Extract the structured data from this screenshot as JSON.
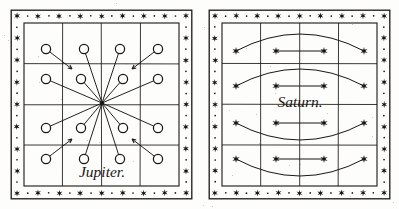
{
  "figure": {
    "medium": "engraved plate",
    "ink_color": "#1a1713",
    "paper_color": "#fdfdfb",
    "panel_count": 2
  },
  "border": {
    "style": "alternating star and dot band",
    "star_glyph": "six-pointed-star",
    "dot_glyph": "round-dot",
    "outer_rule": true,
    "inner_rule": true,
    "stars_per_edge": 8
  },
  "panels": [
    {
      "id": "jupiter",
      "label": "Jupiter.",
      "label_x": 92,
      "label_y": 168,
      "grid": {
        "rows": 4,
        "cols": 4
      },
      "marker_glyph": "open-circle",
      "center": {
        "x": 92,
        "y": 94
      },
      "spokes": [
        {
          "name": "spoke-nnw",
          "x": 74,
          "y": 40
        },
        {
          "name": "spoke-nne",
          "x": 110,
          "y": 40
        },
        {
          "name": "spoke-wnw",
          "x": 36,
          "y": 70
        },
        {
          "name": "spoke-w",
          "x": 71,
          "y": 70
        },
        {
          "name": "spoke-e",
          "x": 113,
          "y": 70
        },
        {
          "name": "spoke-ene",
          "x": 148,
          "y": 70
        },
        {
          "name": "spoke-wsw",
          "x": 36,
          "y": 119
        },
        {
          "name": "spoke-sw",
          "x": 71,
          "y": 119
        },
        {
          "name": "spoke-se",
          "x": 113,
          "y": 119
        },
        {
          "name": "spoke-ese",
          "x": 148,
          "y": 119
        },
        {
          "name": "spoke-ssw",
          "x": 74,
          "y": 150
        },
        {
          "name": "spoke-sse",
          "x": 110,
          "y": 150
        }
      ],
      "corner_arrows": [
        {
          "name": "arrow-top-left",
          "cx": 36,
          "cy": 40,
          "dx": 26,
          "dy": 20
        },
        {
          "name": "arrow-top-right",
          "cx": 148,
          "cy": 40,
          "dx": -26,
          "dy": 20
        },
        {
          "name": "arrow-bottom-left",
          "cx": 36,
          "cy": 150,
          "dx": 26,
          "dy": -20
        },
        {
          "name": "arrow-bottom-right",
          "cx": 148,
          "cy": 150,
          "dx": -26,
          "dy": -20
        }
      ]
    },
    {
      "id": "saturn",
      "label": "Saturn.",
      "label_x": 92,
      "label_y": 98,
      "grid": {
        "rows": 4,
        "cols": 4
      },
      "marker_glyph": "filled-star",
      "rows": [
        {
          "name": "ring-row-1",
          "y": 42,
          "bow": -17,
          "outer_left": 28,
          "outer_right": 156,
          "inner_left": 68,
          "inner_right": 116
        },
        {
          "name": "ring-row-2",
          "y": 77,
          "bow": -17,
          "outer_left": 28,
          "outer_right": 156,
          "inner_left": 68,
          "inner_right": 116
        },
        {
          "name": "ring-row-3",
          "y": 114,
          "bow": 17,
          "outer_left": 28,
          "outer_right": 156,
          "inner_left": 68,
          "inner_right": 116
        },
        {
          "name": "ring-row-4",
          "y": 150,
          "bow": 17,
          "outer_left": 28,
          "outer_right": 156,
          "inner_left": 68,
          "inner_right": 116
        }
      ]
    }
  ]
}
